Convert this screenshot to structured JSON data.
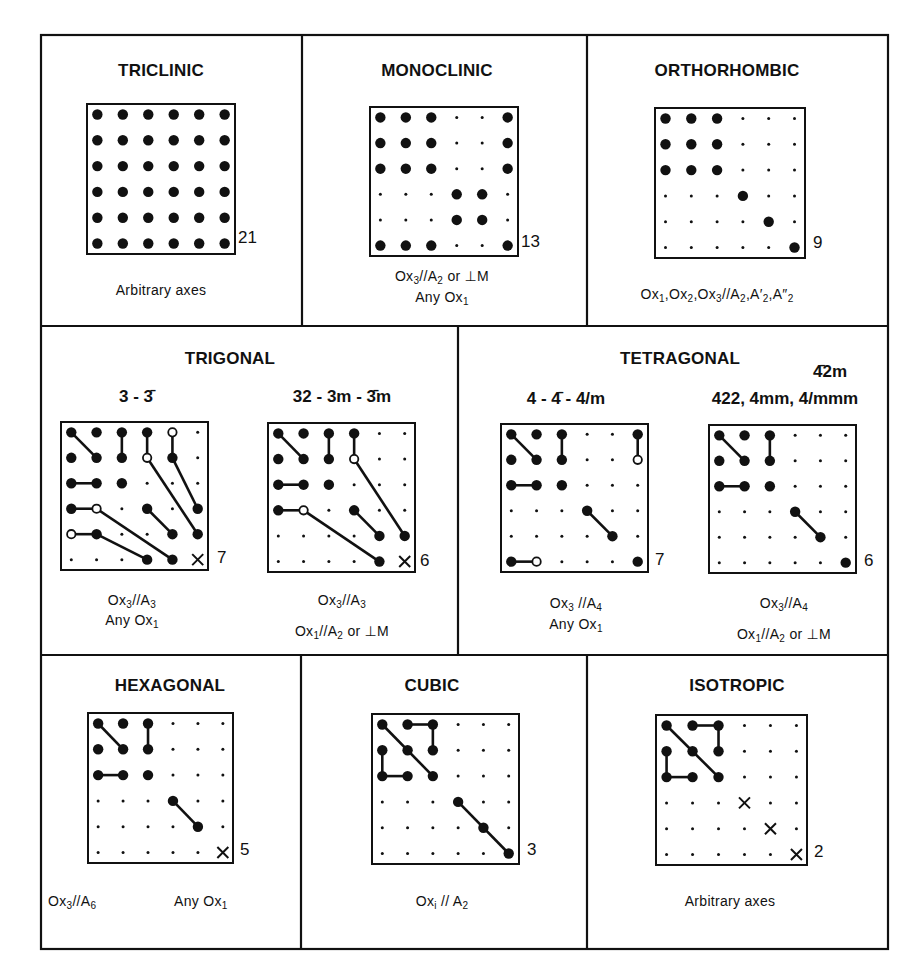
{
  "figure": {
    "legend_symbols": {
      "B": "non-zero component (large filled dot)",
      "S": "zero component (small dot)",
      "O": "component equal to minus the connected filled component (open circle)",
      "X": "component equal to 1/2(c11 - c12) (cross)"
    }
  },
  "panels": {
    "triclinic": {
      "title": "TRICLINIC",
      "count": "21",
      "caption_line1": "Arbitrary axes",
      "grid": [
        "BBBBBB",
        "BBBBBB",
        "BBBBBB",
        "BBBBBB",
        "BBBBBB",
        "BBBBBB"
      ],
      "lines": []
    },
    "monoclinic": {
      "title": "MONOCLINIC",
      "count": "13",
      "caption_line1": "Ox3//A2 or ⊥M",
      "caption_line2": "Any Ox1",
      "grid": [
        "BBBSSB",
        "BBBSSB",
        "BBBSSB",
        "SSSBBS",
        "SSSBBS",
        "BBBSSB"
      ],
      "lines": []
    },
    "orthorhombic": {
      "title": "ORTHORHOMBIC",
      "count": "9",
      "caption_line1": "Ox1,Ox2,Ox3//A2,A′2,A″2",
      "grid": [
        "BBBSSS",
        "BBBSSS",
        "BBBSSS",
        "SSSBSS",
        "SSSSBS",
        "SSSSSB"
      ],
      "lines": []
    },
    "trigonal": {
      "title": "TRIGONAL",
      "left": {
        "classes": "3 - 3̄",
        "count": "7",
        "caption_line1": "Ox3//A3",
        "caption_line2": "Any Ox1",
        "grid": [
          "BBBBOS",
          "BBBOBS",
          "BBBSSS",
          "BOSBSB",
          "OBSSBB",
          "SSSBBX"
        ],
        "lines": [
          [
            0,
            0,
            1,
            1
          ],
          [
            0,
            2,
            1,
            2
          ],
          [
            0,
            3,
            1,
            3
          ],
          [
            0,
            4,
            1,
            4
          ],
          [
            2,
            0,
            2,
            1
          ],
          [
            3,
            0,
            3,
            1
          ],
          [
            4,
            0,
            4,
            1
          ],
          [
            1,
            3,
            4,
            5
          ],
          [
            1,
            4,
            3,
            5
          ],
          [
            3,
            1,
            5,
            4
          ],
          [
            4,
            1,
            5,
            3
          ],
          [
            3,
            3,
            4,
            4
          ]
        ]
      },
      "right": {
        "classes": "32 - 3m - 3̄m",
        "count": "6",
        "caption_line1": "Ox3//A3",
        "caption_line2": "Ox1//A2 or ⊥M",
        "grid": [
          "BBBBSS",
          "BBBOSS",
          "BBBSSS",
          "BOSBSS",
          "SSSSBB",
          "SSSSBX"
        ],
        "lines": [
          [
            0,
            0,
            1,
            1
          ],
          [
            0,
            2,
            1,
            2
          ],
          [
            0,
            3,
            1,
            3
          ],
          [
            2,
            0,
            2,
            1
          ],
          [
            3,
            0,
            3,
            1
          ],
          [
            1,
            3,
            4,
            5
          ],
          [
            3,
            1,
            5,
            4
          ],
          [
            3,
            3,
            4,
            4
          ]
        ]
      }
    },
    "tetragonal": {
      "title": "TETRAGONAL",
      "left": {
        "classes": "4 - 4̄ - 4/m",
        "count": "7",
        "caption_line1": "Ox3 //A4",
        "caption_line2": "Any Ox1",
        "grid": [
          "BBBSSB",
          "BBBSSO",
          "BBBSSS",
          "SSSBSS",
          "SSSSBS",
          "BOSSSB"
        ],
        "lines": [
          [
            0,
            0,
            1,
            1
          ],
          [
            0,
            2,
            1,
            2
          ],
          [
            2,
            0,
            2,
            1
          ],
          [
            3,
            3,
            4,
            4
          ],
          [
            0,
            5,
            1,
            5
          ],
          [
            5,
            0,
            5,
            1
          ]
        ]
      },
      "right": {
        "classes_top": "4̄2m",
        "classes": "422, 4mm, 4/mmm",
        "count": "6",
        "caption_line1": "Ox3//A4",
        "caption_line2": "Ox1//A2 or ⊥M",
        "grid": [
          "BBBSSS",
          "BBBSSS",
          "BBBSSS",
          "SSSBSS",
          "SSSSBS",
          "SSSSSB"
        ],
        "lines": [
          [
            0,
            0,
            1,
            1
          ],
          [
            0,
            2,
            1,
            2
          ],
          [
            2,
            0,
            2,
            1
          ],
          [
            3,
            3,
            4,
            4
          ]
        ]
      }
    },
    "hexagonal": {
      "title": "HEXAGONAL",
      "count": "5",
      "caption_left": "Ox3//A6",
      "caption_right": "Any Ox1",
      "grid": [
        "BBBSSS",
        "BBBSSS",
        "BBBSSS",
        "SSSBSS",
        "SSSSBS",
        "SSSSSX"
      ],
      "lines": [
        [
          0,
          0,
          1,
          1
        ],
        [
          0,
          2,
          1,
          2
        ],
        [
          2,
          0,
          2,
          1
        ],
        [
          3,
          3,
          4,
          4
        ]
      ]
    },
    "cubic": {
      "title": "CUBIC",
      "count": "3",
      "caption_line1": "Oxi // A2",
      "grid": [
        "BBBSSS",
        "BBBSSS",
        "BBBSSS",
        "SSSBSS",
        "SSSSBS",
        "SSSSSB"
      ],
      "lines": [
        [
          0,
          0,
          2,
          2
        ],
        [
          0,
          1,
          0,
          2
        ],
        [
          0,
          2,
          1,
          2
        ],
        [
          1,
          0,
          2,
          0
        ],
        [
          2,
          0,
          2,
          1
        ],
        [
          3,
          3,
          5,
          5
        ]
      ]
    },
    "isotropic": {
      "title": "ISOTROPIC",
      "count": "2",
      "caption_line1": "Arbitrary axes",
      "grid": [
        "BBBSSS",
        "BBBSSS",
        "BBBSSS",
        "SSSXSS",
        "SSSSXS",
        "SSSSSX"
      ],
      "lines": [
        [
          0,
          0,
          2,
          2
        ],
        [
          0,
          1,
          0,
          2
        ],
        [
          0,
          2,
          1,
          2
        ],
        [
          1,
          0,
          2,
          0
        ],
        [
          2,
          0,
          2,
          1
        ]
      ]
    }
  },
  "colors": {
    "ink": "#111111",
    "paper": "#ffffff"
  }
}
